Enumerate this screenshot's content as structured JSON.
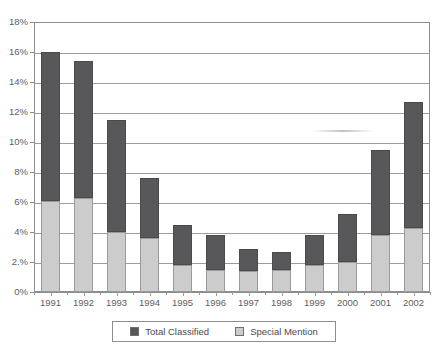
{
  "chart_data": {
    "type": "bar",
    "title": "",
    "xlabel": "",
    "ylabel": "",
    "ylim": [
      0,
      18
    ],
    "ytick_labels": [
      "0%",
      "2.%",
      "4%",
      "6%",
      "8%",
      "10%",
      "12%",
      "14%",
      "16%",
      "18%"
    ],
    "yticks": [
      0,
      2,
      4,
      6,
      8,
      10,
      12,
      14,
      16,
      18
    ],
    "grid": true,
    "stacked": true,
    "legend_position": "bottom",
    "categories": [
      "1991",
      "1992",
      "1993",
      "1994",
      "1995",
      "1996",
      "1997",
      "1998",
      "1999",
      "2000",
      "2001",
      "2002"
    ],
    "series": [
      {
        "name": "Total Classified",
        "color": "#58585a",
        "values": [
          16.0,
          15.4,
          11.5,
          7.6,
          4.5,
          3.8,
          2.9,
          2.7,
          3.8,
          5.2,
          9.5,
          12.7
        ]
      },
      {
        "name": "Special Mention",
        "color": "#cccccc",
        "values": [
          6.1,
          6.3,
          4.0,
          3.6,
          1.8,
          1.5,
          1.4,
          1.5,
          1.8,
          2.0,
          3.8,
          4.3
        ]
      }
    ]
  },
  "legend": {
    "items": [
      {
        "label": "Total Classified",
        "swatch": "total"
      },
      {
        "label": "Special Mention",
        "swatch": "special"
      }
    ]
  }
}
